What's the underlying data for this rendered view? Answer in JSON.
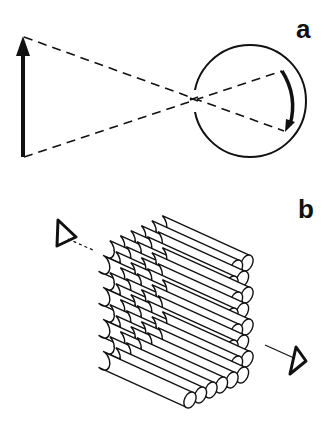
{
  "panels": [
    {
      "id": "a",
      "label": "a",
      "description": "Object arrow and inverted image on retina through eye (dashed projection lines crossing at the pupil)"
    },
    {
      "id": "b",
      "label": "b",
      "description": "Hexagonally packed bundle of cylindrical rods with viewing-direction eye symbols at both ends"
    }
  ],
  "colors": {
    "stroke": "#111111",
    "background": "#ffffff"
  }
}
